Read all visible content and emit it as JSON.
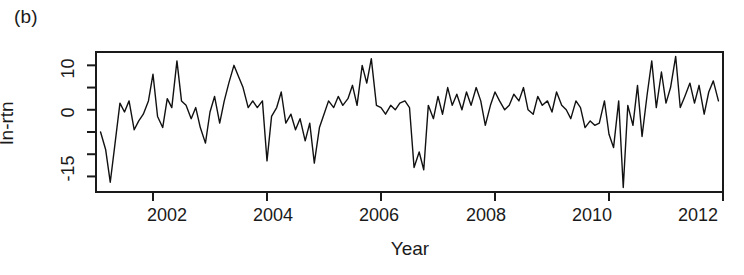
{
  "figure": {
    "panel_label": "(b)",
    "background_color": "#ffffff",
    "line_color": "#111111",
    "axis_color": "#1a1a1a"
  },
  "chart_data": {
    "type": "line",
    "title": "(b)",
    "subtitle": "",
    "xlabel": "Year",
    "ylabel": "ln-rtn",
    "xlim": [
      2001.0,
      2012.0
    ],
    "ylim": [
      -18.5,
      13.0
    ],
    "grid": false,
    "legend": null,
    "x_ticks": [
      2002,
      2004,
      2006,
      2008,
      2010,
      2012
    ],
    "x_tick_labels": [
      "2002",
      "2004",
      "2006",
      "2008",
      "2010",
      "2012"
    ],
    "y_ticks": [
      -15,
      -10,
      -5,
      0,
      5,
      10
    ],
    "y_tick_labels": [
      "-15",
      "",
      "",
      "0",
      "",
      "10"
    ],
    "y_labeled_ticks": [
      {
        "value": 10,
        "label": "10"
      },
      {
        "value": 0,
        "label": "0"
      },
      {
        "value": -15,
        "label": "-15"
      }
    ],
    "series": [
      {
        "name": "ln-rtn",
        "x": [
          2001.08,
          2001.17,
          2001.25,
          2001.33,
          2001.42,
          2001.5,
          2001.58,
          2001.67,
          2001.75,
          2001.83,
          2001.92,
          2002.0,
          2002.08,
          2002.17,
          2002.25,
          2002.33,
          2002.42,
          2002.5,
          2002.58,
          2002.67,
          2002.75,
          2002.83,
          2002.92,
          2003.0,
          2003.08,
          2003.17,
          2003.25,
          2003.33,
          2003.42,
          2003.5,
          2003.58,
          2003.67,
          2003.75,
          2003.83,
          2003.92,
          2004.0,
          2004.08,
          2004.17,
          2004.25,
          2004.33,
          2004.42,
          2004.5,
          2004.58,
          2004.67,
          2004.75,
          2004.83,
          2004.92,
          2005.0,
          2005.08,
          2005.17,
          2005.25,
          2005.33,
          2005.42,
          2005.5,
          2005.58,
          2005.67,
          2005.75,
          2005.83,
          2005.92,
          2006.0,
          2006.08,
          2006.17,
          2006.25,
          2006.33,
          2006.42,
          2006.5,
          2006.58,
          2006.67,
          2006.75,
          2006.83,
          2006.92,
          2007.0,
          2007.08,
          2007.17,
          2007.25,
          2007.33,
          2007.42,
          2007.5,
          2007.58,
          2007.67,
          2007.75,
          2007.83,
          2007.92,
          2008.0,
          2008.08,
          2008.17,
          2008.25,
          2008.33,
          2008.42,
          2008.5,
          2008.58,
          2008.67,
          2008.75,
          2008.83,
          2008.92,
          2009.0,
          2009.08,
          2009.17,
          2009.25,
          2009.33,
          2009.42,
          2009.5,
          2009.58,
          2009.67,
          2009.75,
          2009.83,
          2009.92,
          2010.0,
          2010.08,
          2010.17,
          2010.25,
          2010.33,
          2010.42,
          2010.5,
          2010.58,
          2010.67,
          2010.75,
          2010.83,
          2010.92,
          2011.0,
          2011.08,
          2011.17,
          2011.25,
          2011.33,
          2011.42,
          2011.5,
          2011.58,
          2011.67,
          2011.75,
          2011.83,
          2011.92
        ],
        "y": [
          -5.0,
          -9.0,
          -16.3,
          -8.0,
          1.5,
          -0.5,
          2.0,
          -4.5,
          -2.5,
          -1.0,
          2.0,
          8.0,
          -1.5,
          -4.0,
          2.5,
          0.5,
          11.0,
          2.0,
          1.0,
          -2.0,
          0.5,
          -4.0,
          -7.5,
          -0.5,
          3.0,
          -3.0,
          2.0,
          6.0,
          10.0,
          7.5,
          5.0,
          0.5,
          2.0,
          0.5,
          2.0,
          -11.5,
          -1.5,
          0.5,
          4.0,
          -3.0,
          -1.0,
          -4.5,
          -2.0,
          -7.0,
          -3.0,
          -12.0,
          -4.0,
          -1.0,
          2.0,
          0.5,
          3.0,
          1.0,
          2.5,
          5.5,
          1.0,
          10.0,
          6.0,
          11.5,
          1.0,
          0.5,
          -1.0,
          1.0,
          0.0,
          1.5,
          2.0,
          0.5,
          -13.0,
          -9.5,
          -13.5,
          1.0,
          -2.0,
          3.0,
          -1.0,
          5.0,
          1.0,
          3.5,
          0.0,
          4.0,
          1.0,
          5.0,
          2.0,
          -3.5,
          1.0,
          4.0,
          2.0,
          0.0,
          1.0,
          3.5,
          2.0,
          5.0,
          0.0,
          -1.0,
          3.0,
          1.0,
          2.0,
          -0.5,
          4.0,
          1.0,
          0.0,
          -2.0,
          2.0,
          0.5,
          -4.0,
          -2.5,
          -3.5,
          -3.0,
          2.0,
          -5.5,
          -8.5,
          2.0,
          -17.5,
          1.0,
          -3.5,
          5.5,
          -6.0,
          3.5,
          11.0,
          0.5,
          8.5,
          1.5,
          5.0,
          12.0,
          0.5,
          3.0,
          6.0,
          1.5,
          5.5,
          -1.0,
          4.0,
          6.5,
          2.0
        ]
      }
    ],
    "note": "Monthly log-returns series; sharp negative outlier near late 2008, recovery spikes through 2009-2011."
  }
}
